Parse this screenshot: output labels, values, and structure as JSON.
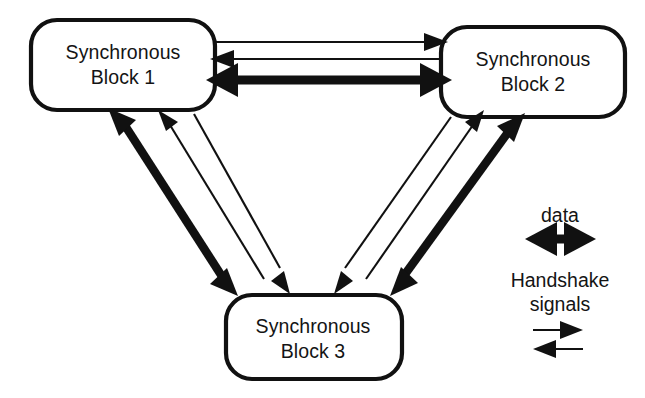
{
  "diagram": {
    "background_color": "#ffffff",
    "line_color": "#111111",
    "blocks": [
      {
        "id": "block1",
        "line1": "Synchronous",
        "line2": "Block 1",
        "label": "Synchronous\nBlock 1"
      },
      {
        "id": "block2",
        "line1": "Synchronous",
        "line2": "Block 2",
        "label": "Synchronous\nBlock 2"
      },
      {
        "id": "block3",
        "line1": "Synchronous",
        "line2": "Block 3",
        "label": "Synchronous\nBlock 3"
      }
    ],
    "connections": [
      {
        "from": "block1",
        "to": "block2",
        "kind": "handshake",
        "direction": "right"
      },
      {
        "from": "block2",
        "to": "block1",
        "kind": "handshake",
        "direction": "left"
      },
      {
        "from": "block1",
        "to": "block2",
        "kind": "data",
        "direction": "both"
      },
      {
        "from": "block1",
        "to": "block3",
        "kind": "data",
        "direction": "both"
      },
      {
        "from": "block3",
        "to": "block1",
        "kind": "handshake",
        "direction": "up"
      },
      {
        "from": "block1",
        "to": "block3",
        "kind": "handshake",
        "direction": "down"
      },
      {
        "from": "block2",
        "to": "block3",
        "kind": "data",
        "direction": "both"
      },
      {
        "from": "block3",
        "to": "block2",
        "kind": "handshake",
        "direction": "up"
      },
      {
        "from": "block2",
        "to": "block3",
        "kind": "handshake",
        "direction": "down"
      }
    ]
  },
  "legend": {
    "data_label": "data",
    "handshake_label": "Handshake\nsignals",
    "handshake_line1": "Handshake",
    "handshake_line2": "signals",
    "items": [
      {
        "name": "data",
        "arrow": "thick-double-arrow"
      },
      {
        "name": "Handshake signals",
        "arrow": "thin-right-arrow"
      },
      {
        "name": "Handshake signals",
        "arrow": "thin-left-arrow"
      }
    ]
  }
}
